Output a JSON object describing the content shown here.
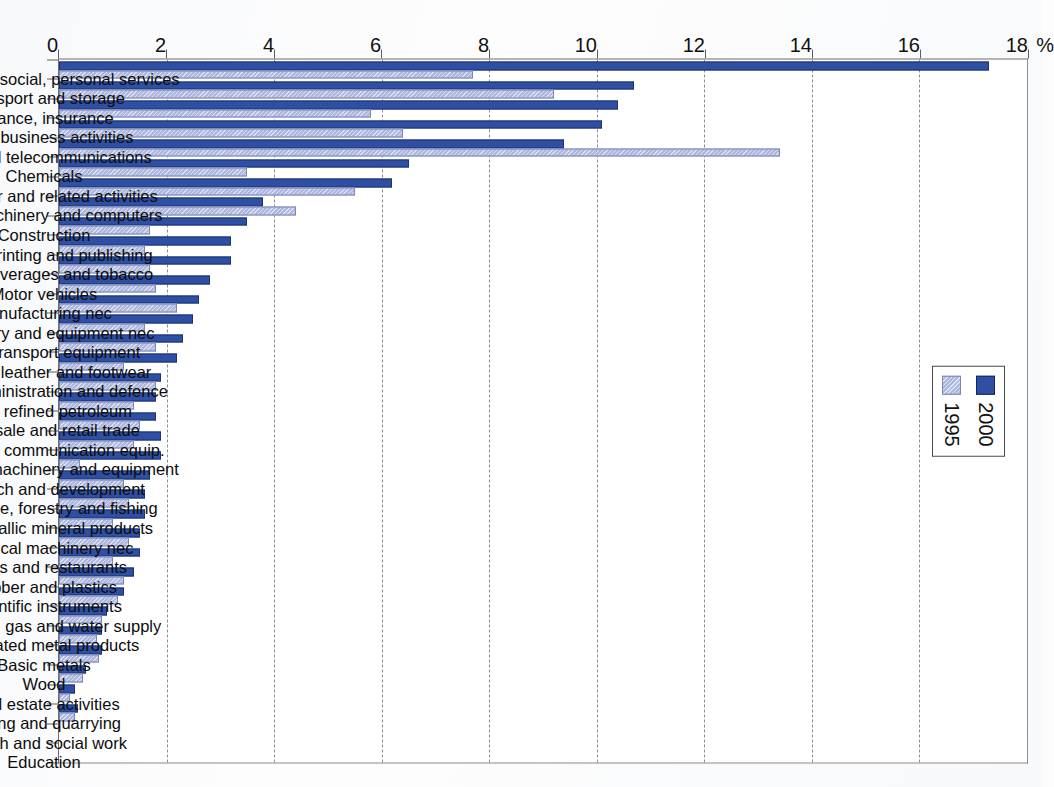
{
  "colors": {
    "series_2000": "#2e4fa2",
    "series_1995": "#aeb7dd",
    "axis": "#5d5d5d",
    "grid": "#8e8e8e"
  },
  "legend": {
    "position": "top-center-inside",
    "entries": [
      {
        "label": "2000",
        "color": "#2e4fa2"
      },
      {
        "label": "1995",
        "color": "#aeb7dd"
      }
    ]
  },
  "axis": {
    "value_unit": "%",
    "ticks": [
      "0",
      "2",
      "4",
      "6",
      "8",
      "10",
      "12",
      "14",
      "16",
      "18"
    ]
  },
  "chart_data": {
    "type": "bar",
    "title": "",
    "subtitle": "",
    "xlabel": "",
    "ylabel": "%",
    "ylim": [
      0,
      18
    ],
    "ytick_step": 2,
    "grid": true,
    "orientation": "vertical-bars-on-rotated-page",
    "legend_position": "top-center",
    "categories": [
      "Community, social, personal services",
      "Transport and storage",
      "Finance, insurance",
      "Other business activities",
      "Post and telecommunications",
      "Chemicals",
      "Computer and related activities",
      "Office machinery and computers",
      "Construction",
      "Paper, printing and publishing",
      "Food, beverages and tobacco",
      "Motor vehicles",
      "Manufacturing nec",
      "Machinery and equipment nec",
      "Other transport equipment",
      "Textiles, leather and footwear",
      "Public administration and defence",
      "Coke, refined petroleum",
      "Wholesale and retail trade",
      "Radio, TV, communication equip.",
      "Renting of machinery and equipment",
      "Research and development",
      "Agriculture, forestry and fishing",
      "Non-metallic mineral products",
      "Electrical machinery nec",
      "Hotels and restaurants",
      "Rubber and plastics",
      "Scientific instruments",
      "Electricity, gas and water supply",
      "Fabricated metal products",
      "Basic metals",
      "Wood",
      "Real estate activities",
      "Mining and quarrying",
      "Health and social work",
      "Education"
    ],
    "series": [
      {
        "name": "2000",
        "color": "#2e4fa2",
        "values": [
          17.3,
          10.7,
          10.4,
          10.1,
          9.4,
          6.5,
          6.2,
          3.8,
          3.5,
          3.2,
          3.2,
          2.8,
          2.6,
          2.5,
          2.3,
          2.2,
          1.9,
          1.8,
          1.8,
          1.9,
          1.9,
          1.7,
          1.6,
          1.6,
          1.5,
          1.5,
          1.4,
          1.2,
          0.9,
          0.8,
          0.8,
          0.5,
          0.3,
          0.35,
          0.0,
          0.0
        ]
      },
      {
        "name": "1995",
        "color": "#aeb7dd",
        "values": [
          7.7,
          9.2,
          5.8,
          6.4,
          13.4,
          3.5,
          5.5,
          4.4,
          1.7,
          1.6,
          1.7,
          1.8,
          2.2,
          1.6,
          1.8,
          1.2,
          1.8,
          1.4,
          1.5,
          1.4,
          0.4,
          1.2,
          1.3,
          1.0,
          1.3,
          1.0,
          1.2,
          1.1,
          0.8,
          0.7,
          0.75,
          0.45,
          0.2,
          0.3,
          0.0,
          0.0
        ]
      }
    ]
  }
}
